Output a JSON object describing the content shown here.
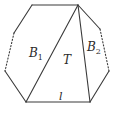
{
  "diagram": {
    "stroke_color": "#3a3a3a",
    "vertices": {
      "top_left": [
        32,
        5
      ],
      "apex": [
        78,
        5
      ],
      "left_upper": [
        14,
        33
      ],
      "left_lower": [
        5,
        71
      ],
      "bottom_left": [
        26,
        102
      ],
      "bottom_right": [
        90,
        102
      ],
      "right_lower": [
        109,
        71
      ],
      "right_upper": [
        100,
        29
      ]
    },
    "labels": {
      "b1": {
        "base": "B",
        "sub": "1"
      },
      "t": "T",
      "b2": {
        "base": "B",
        "sub": "2"
      },
      "l": "l"
    }
  }
}
